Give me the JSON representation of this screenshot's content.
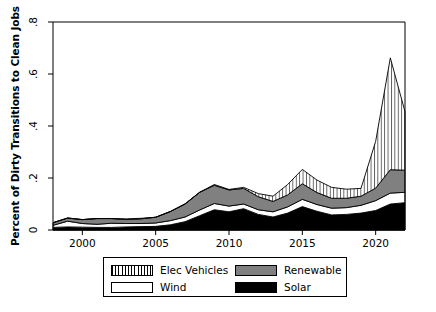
{
  "chart_data": {
    "type": "area",
    "title": "",
    "subtitle": "",
    "xlabel": "",
    "ylabel": "Percent of Dirty Transitions to Clean Jobs",
    "stacked": true,
    "grid": false,
    "legend_position": "bottom",
    "xlim": [
      1998,
      2022
    ],
    "ylim": [
      0,
      0.8
    ],
    "xticks": [
      2000,
      2005,
      2010,
      2015,
      2020
    ],
    "xtick_labels": [
      "2000",
      "2005",
      "2010",
      "2015",
      "2020"
    ],
    "yticks": [
      0,
      0.2,
      0.4,
      0.6,
      0.8
    ],
    "ytick_labels": [
      "0",
      ".2",
      ".4",
      ".6",
      ".8"
    ],
    "x": [
      1998,
      1999,
      2000,
      2001,
      2002,
      2003,
      2004,
      2005,
      2006,
      2007,
      2008,
      2009,
      2010,
      2011,
      2012,
      2013,
      2014,
      2015,
      2016,
      2017,
      2018,
      2019,
      2020,
      2021,
      2022
    ],
    "series": [
      {
        "name": "Solar",
        "fill": "#000000",
        "pattern": "solid",
        "values": [
          0.01,
          0.012,
          0.011,
          0.01,
          0.01,
          0.012,
          0.013,
          0.014,
          0.02,
          0.032,
          0.055,
          0.078,
          0.07,
          0.082,
          0.06,
          0.05,
          0.065,
          0.09,
          0.072,
          0.058,
          0.06,
          0.065,
          0.075,
          0.1,
          0.105
        ]
      },
      {
        "name": "Wind",
        "fill": "#ffffff",
        "pattern": "solid",
        "values": [
          0.008,
          0.022,
          0.014,
          0.012,
          0.016,
          0.013,
          0.012,
          0.013,
          0.016,
          0.018,
          0.022,
          0.024,
          0.022,
          0.018,
          0.018,
          0.02,
          0.024,
          0.028,
          0.026,
          0.026,
          0.026,
          0.03,
          0.038,
          0.042,
          0.04
        ]
      },
      {
        "name": "Renewable",
        "fill": "#808080",
        "pattern": "solid",
        "values": [
          0.01,
          0.012,
          0.015,
          0.022,
          0.018,
          0.015,
          0.018,
          0.022,
          0.035,
          0.05,
          0.068,
          0.07,
          0.062,
          0.06,
          0.05,
          0.04,
          0.046,
          0.06,
          0.046,
          0.038,
          0.036,
          0.035,
          0.048,
          0.09,
          0.085
        ]
      },
      {
        "name": "Elec Vehicles",
        "fill": "#ffffff",
        "pattern": "vertical-hatch",
        "values": [
          0.0,
          0.0,
          0.0,
          0.0,
          0.0,
          0.003,
          0.002,
          0.0,
          0.0,
          0.0,
          0.0,
          0.003,
          0.002,
          0.004,
          0.012,
          0.02,
          0.04,
          0.055,
          0.048,
          0.042,
          0.035,
          0.03,
          0.18,
          0.43,
          0.225
        ]
      }
    ]
  },
  "legend": {
    "items": [
      {
        "label": "Elec Vehicles",
        "key": "key-ev"
      },
      {
        "label": "Renewable",
        "key": "key-renew"
      },
      {
        "label": "Wind",
        "key": "key-wind"
      },
      {
        "label": "Solar",
        "key": "key-solar"
      }
    ]
  },
  "colors": {
    "axis": "#000000",
    "background": "#ffffff",
    "renewable": "#808080",
    "solar": "#000000",
    "wind": "#ffffff",
    "elec_vehicles": "#ffffff"
  }
}
